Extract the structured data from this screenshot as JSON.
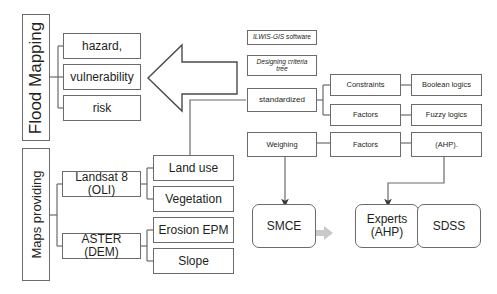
{
  "diagram": {
    "stroke_color": "#6b6b6b",
    "text_color": "#231f20",
    "gray_arrow_color": "#c9c9c9",
    "background": "#ffffff"
  },
  "groups": {
    "flood_mapping_label": "Flood Mapping",
    "maps_providing_label": "Maps providing"
  },
  "flood_outputs": [
    {
      "label": "hazard,"
    },
    {
      "label": "vulnerability"
    },
    {
      "label": "risk"
    }
  ],
  "sensors": [
    {
      "label": "Landsat 8 (OLI)"
    },
    {
      "label": "ASTER (DEM)"
    }
  ],
  "derived_maps": [
    {
      "label": "Land use"
    },
    {
      "label": "Vegetation"
    },
    {
      "label": "Erosion EPM"
    },
    {
      "label": "Slope"
    }
  ],
  "software": {
    "ilwis_prefix": "ILWIS-GIS",
    "ilwis_suffix": " software",
    "criteria_tree": "Designing criteria tree",
    "standardized": "standardized"
  },
  "criteria": {
    "constraints": "Constraints",
    "factors_top": "Factors",
    "boolean_logics": "Boolean logics",
    "fuzzy_logics": "Fuzzy logics"
  },
  "weighting": {
    "weighing": "Weighing",
    "factors": "Factors",
    "ahp": "(AHP)."
  },
  "pipeline": [
    {
      "label": "SMCE"
    },
    {
      "label": "Experts\n(AHP)"
    },
    {
      "label": "SDSS"
    }
  ],
  "pipeline_lines": {
    "smce": "SMCE",
    "experts_1": "Experts",
    "experts_2": "(AHP)",
    "sdss": "SDSS"
  },
  "icons": {
    "big_left_arrow": "big-left-arrow",
    "flow_arrow": "flow-arrow"
  }
}
